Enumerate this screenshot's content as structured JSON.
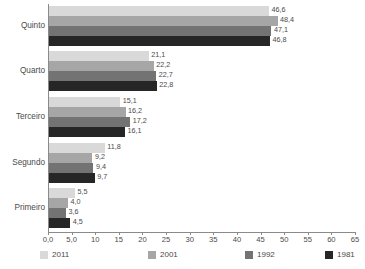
{
  "chart_data": {
    "type": "bar",
    "orientation": "horizontal",
    "title": "",
    "subtitle": "",
    "xlabel": "",
    "ylabel": "",
    "categories": [
      "Quinto",
      "Quarto",
      "Terceiro",
      "Segundo",
      "Primeiro"
    ],
    "series": [
      {
        "name": "2011",
        "color": "#d9d9d9",
        "values": [
          46.6,
          21.1,
          15.1,
          11.8,
          5.5
        ]
      },
      {
        "name": "2001",
        "color": "#a6a6a6",
        "values": [
          48.4,
          22.2,
          16.2,
          9.2,
          4.0
        ]
      },
      {
        "name": "1992",
        "color": "#737373",
        "values": [
          47.1,
          22.7,
          17.2,
          9.4,
          3.6
        ]
      },
      {
        "name": "1981",
        "color": "#262626",
        "values": [
          46.8,
          22.8,
          16.1,
          9.7,
          4.5
        ]
      }
    ],
    "value_labels": [
      [
        "46,6",
        "48,4",
        "47,1",
        "46,8"
      ],
      [
        "21,1",
        "22,2",
        "22,7",
        "22,8"
      ],
      [
        "15,1",
        "16,2",
        "17,2",
        "16,1"
      ],
      [
        "11,8",
        "9,2",
        "9,4",
        "9,7"
      ],
      [
        "5,5",
        "4,0",
        "3,6",
        "4,5"
      ]
    ],
    "xlim": [
      0,
      65
    ],
    "xticks": [
      0,
      5,
      10,
      15,
      20,
      25,
      30,
      35,
      40,
      45,
      50,
      55,
      60,
      65
    ],
    "xtick_labels": [
      "0,0",
      "5,0",
      "10",
      "15",
      "20",
      "25",
      "30",
      "35",
      "40",
      "45",
      "50",
      "55",
      "60",
      "65"
    ],
    "grid": false,
    "legend_position": "bottom",
    "axis_color": "#8a8a8a",
    "text_color": "#4a4a4a",
    "background": "#ffffff"
  }
}
